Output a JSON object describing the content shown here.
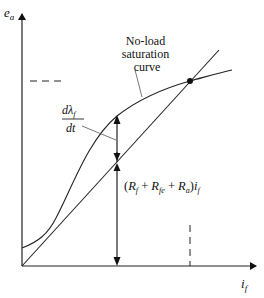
{
  "diagram": {
    "y_axis_label": "e",
    "y_axis_sub": "a",
    "x_axis_label": "i",
    "x_axis_sub": "f",
    "curve_label_line1": "No-load",
    "curve_label_line2": "saturation",
    "curve_label_line3": "curve",
    "dlambda_num": "dλ",
    "dlambda_num_sub": "f",
    "dlambda_den": "dt",
    "resistance_expr": {
      "open": "(",
      "r1": "R",
      "r1_sub": "f",
      "plus1": " + ",
      "r2": "R",
      "r2_sub": "fe",
      "plus2": " + ",
      "r3": "R",
      "r3_sub": "a",
      "close": ")",
      "i": "i",
      "i_sub": "f"
    },
    "colors": {
      "line": "#222222",
      "background": "#ffffff"
    }
  }
}
